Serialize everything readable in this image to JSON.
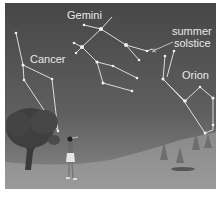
{
  "scene": {
    "description": "Night sky illustration with constellations above a landscape with a tree and a person",
    "colors": {
      "sky_top": "#4a4a4a",
      "sky_bottom": "#7a7a7a",
      "ground": "#8c8c8c",
      "star": "#f2f2f2",
      "line": "#dcdcdc"
    },
    "labels": {
      "gemini": "Gemini",
      "cancer": "Cancer",
      "summer_line1": "summer",
      "summer_line2": "solstice",
      "orion": "Orion"
    }
  }
}
